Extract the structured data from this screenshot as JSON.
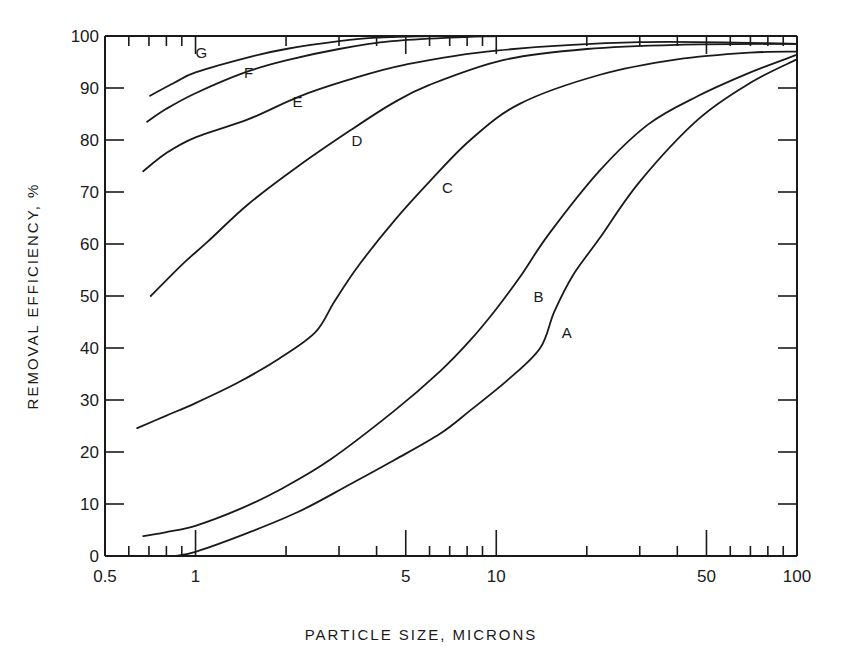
{
  "chart_data": {
    "type": "line",
    "title": "",
    "xlabel": "PARTICLE SIZE, MICRONS",
    "ylabel": "REMOVAL EFFICIENCY, %",
    "xscale": "log",
    "xlim": [
      0.5,
      100
    ],
    "ylim": [
      0,
      100
    ],
    "grid": false,
    "legend": "inline curve labels",
    "x_tick_labels": [
      {
        "value": 0.5,
        "label": "0.5"
      },
      {
        "value": 1,
        "label": "1"
      },
      {
        "value": 5,
        "label": "5"
      },
      {
        "value": 10,
        "label": "10"
      },
      {
        "value": 50,
        "label": "50"
      },
      {
        "value": 100,
        "label": "100"
      }
    ],
    "x_minor_ticks": [
      0.6,
      0.7,
      0.8,
      0.9,
      2,
      3,
      4,
      6,
      7,
      8,
      9,
      20,
      30,
      40,
      60,
      70,
      80,
      90
    ],
    "x_major_ticks": [
      1,
      5,
      10,
      50
    ],
    "y_ticks": [
      0,
      10,
      20,
      30,
      40,
      50,
      60,
      70,
      80,
      90,
      100
    ],
    "y_tick_labels": [
      "0",
      "10",
      "20",
      "30",
      "40",
      "50",
      "60",
      "70",
      "80",
      "90",
      "100"
    ],
    "series": [
      {
        "name": "A",
        "label_at": [
          16.5,
          43
        ],
        "x": [
          0.85,
          1.0,
          1.5,
          2.2,
          3.2,
          4.6,
          6.5,
          8.2,
          11,
          14,
          15.6,
          18,
          22,
          30,
          47,
          70,
          99
        ],
        "y": [
          0,
          0.8,
          4.5,
          8.5,
          13.5,
          18.5,
          23.5,
          28,
          34,
          40,
          47,
          54,
          61,
          72,
          84,
          91,
          95.4
        ]
      },
      {
        "name": "B",
        "label_at": [
          13.3,
          50
        ],
        "x": [
          0.67,
          0.8,
          1.0,
          1.4,
          1.9,
          2.8,
          4.6,
          6.5,
          8.2,
          10,
          12.1,
          15,
          22,
          32,
          47,
          70,
          99
        ],
        "y": [
          3.8,
          4.6,
          5.8,
          9,
          12.7,
          18.5,
          28,
          35.5,
          41.5,
          47.5,
          54,
          62,
          74,
          83,
          88.5,
          93,
          96.3
        ]
      },
      {
        "name": "C",
        "label_at": [
          6.6,
          71
        ],
        "x": [
          0.64,
          0.8,
          1.0,
          1.4,
          1.9,
          2.5,
          2.9,
          3.5,
          4.6,
          6.0,
          8.2,
          12,
          22,
          40,
          70,
          100
        ],
        "y": [
          24.6,
          27,
          29.4,
          33.5,
          38,
          43,
          49,
          56,
          64.6,
          72,
          80,
          87,
          92.5,
          95.5,
          96.8,
          97
        ]
      },
      {
        "name": "D",
        "label_at": [
          3.3,
          80
        ],
        "x": [
          0.71,
          0.9,
          1.1,
          1.5,
          2.2,
          3.3,
          4.5,
          6.0,
          10.6,
          20,
          40,
          100
        ],
        "y": [
          50,
          56,
          60.5,
          67.7,
          75,
          82,
          87,
          90.6,
          95.4,
          97.5,
          98.3,
          98.5
        ]
      },
      {
        "name": "E",
        "label_at": [
          2.1,
          87.5
        ],
        "x": [
          0.67,
          0.8,
          1.0,
          1.5,
          2.2,
          3.2,
          5,
          10,
          30,
          100
        ],
        "y": [
          74,
          77.5,
          80.5,
          84,
          88.3,
          91.5,
          94.5,
          97.2,
          98.8,
          98.5
        ]
      },
      {
        "name": "F",
        "label_at": [
          1.45,
          93
        ],
        "x": [
          0.69,
          0.8,
          1.0,
          1.46,
          2.0,
          3.0,
          4.5,
          7,
          10
        ],
        "y": [
          83.5,
          86,
          89,
          93,
          95.3,
          97.5,
          99,
          99.7,
          100
        ]
      },
      {
        "name": "G",
        "label_at": [
          1.0,
          97
        ],
        "x": [
          0.706,
          0.85,
          1.0,
          1.52,
          2.0,
          3.0,
          4.0,
          6
        ],
        "y": [
          88.5,
          91,
          93,
          96,
          97.5,
          99,
          99.7,
          100
        ]
      }
    ]
  }
}
